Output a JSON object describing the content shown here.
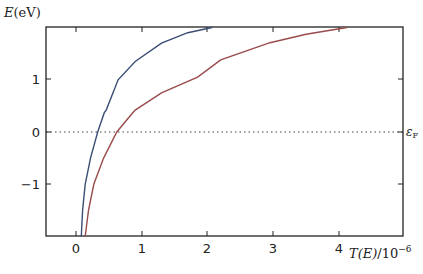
{
  "chart_data": {
    "type": "line",
    "title": "",
    "xlabel": "T(E)/10^-6",
    "ylabel": "E(eV)",
    "xlim": [
      -0.45,
      4.97
    ],
    "ylim": [
      -2,
      2
    ],
    "xticks": [
      0,
      1,
      2,
      3,
      4
    ],
    "yticks": [
      -1,
      0,
      1
    ],
    "grid": false,
    "legend": null,
    "annotations": [
      {
        "text": "ε_F",
        "y": 0,
        "position": "right of axes",
        "line_style": "dotted horizontal line at E=0"
      }
    ],
    "series": [
      {
        "name": "blue curve",
        "color": "#3b4d75",
        "x": [
          0.08,
          0.1,
          0.14,
          0.22,
          0.33,
          0.43,
          0.46,
          0.64,
          0.9,
          1.3,
          1.7,
          2.07
        ],
        "y": [
          -2.0,
          -1.5,
          -1.0,
          -0.5,
          0.0,
          0.37,
          0.42,
          1.0,
          1.35,
          1.7,
          1.9,
          2.0
        ]
      },
      {
        "name": "red curve",
        "color": "#9a4b4b",
        "x": [
          0.14,
          0.19,
          0.27,
          0.42,
          0.62,
          0.85,
          0.9,
          1.3,
          1.85,
          2.2,
          2.95,
          3.5,
          4.12
        ],
        "y": [
          -2.0,
          -1.5,
          -1.0,
          -0.5,
          0.0,
          0.35,
          0.42,
          0.75,
          1.05,
          1.38,
          1.71,
          1.87,
          2.0
        ]
      }
    ]
  },
  "labels": {
    "ylabel_main": "E",
    "ylabel_unit": "(eV)",
    "xlabel_main": "T(E)",
    "xlabel_div": "/10",
    "xlabel_exp": "−6",
    "fermi_main": "ε",
    "fermi_sub": "F",
    "xtick_labels": [
      "0",
      "1",
      "2",
      "3",
      "4"
    ],
    "ytick_labels": [
      "1",
      "0",
      "−1"
    ]
  },
  "colors": {
    "axis": "#222222",
    "blue": "#3b4d75",
    "red": "#9a4b4b",
    "fermi_line": "#444444"
  }
}
